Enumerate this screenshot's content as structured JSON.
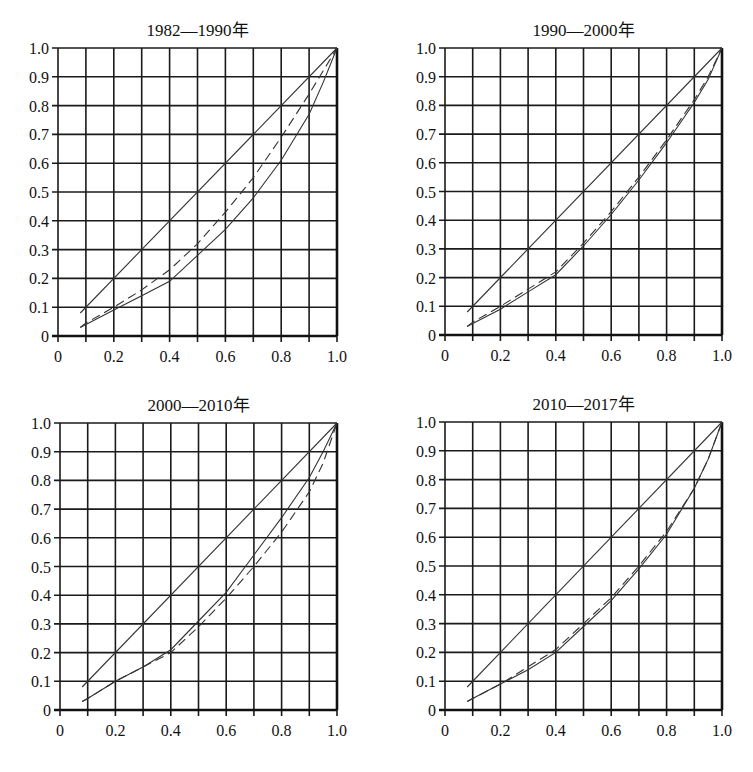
{
  "chart_data": [
    {
      "type": "line",
      "title": "1982—1990年",
      "xlabel": "",
      "ylabel": "",
      "xlim": [
        0,
        1.0
      ],
      "ylim": [
        0,
        1.0
      ],
      "grid": true,
      "x_ticks": [
        "0",
        "0.2",
        "0.4",
        "0.6",
        "0.8",
        "1.0"
      ],
      "y_ticks": [
        "0",
        "0.1",
        "0.2",
        "0.3",
        "0.4",
        "0.5",
        "0.6",
        "0.7",
        "0.8",
        "0.9",
        "1.0"
      ],
      "layout": {
        "x0": 58,
        "x1": 337,
        "y0": 336,
        "y1": 48
      },
      "series": [
        {
          "name": "equality-line",
          "style": "solid-thin",
          "x": [
            0.08,
            1.0
          ],
          "y": [
            0.08,
            1.0
          ]
        },
        {
          "name": "curve-solid",
          "style": "solid",
          "x": [
            0.08,
            0.1,
            0.2,
            0.3,
            0.4,
            0.5,
            0.6,
            0.7,
            0.8,
            0.9,
            0.95,
            1.0
          ],
          "y": [
            0.03,
            0.04,
            0.09,
            0.14,
            0.19,
            0.28,
            0.37,
            0.48,
            0.61,
            0.77,
            0.88,
            1.0
          ]
        },
        {
          "name": "curve-dashed",
          "style": "dashed",
          "x": [
            0.08,
            0.1,
            0.2,
            0.3,
            0.4,
            0.5,
            0.6,
            0.7,
            0.8,
            0.9,
            0.95,
            1.0
          ],
          "y": [
            0.03,
            0.045,
            0.1,
            0.16,
            0.23,
            0.32,
            0.43,
            0.55,
            0.69,
            0.84,
            0.92,
            1.0
          ]
        }
      ]
    },
    {
      "type": "line",
      "title": "1990—2000年",
      "xlabel": "",
      "ylabel": "",
      "xlim": [
        0,
        1.0
      ],
      "ylim": [
        0,
        1.0
      ],
      "grid": true,
      "x_ticks": [
        "0",
        "0.2",
        "0.4",
        "0.6",
        "0.8",
        "1.0"
      ],
      "y_ticks": [
        "0",
        "0.1",
        "0.2",
        "0.3",
        "0.4",
        "0.5",
        "0.6",
        "0.7",
        "0.8",
        "0.9",
        "1.0"
      ],
      "layout": {
        "x0": 445,
        "x1": 722,
        "y0": 335,
        "y1": 48
      },
      "series": [
        {
          "name": "equality-line",
          "style": "solid-thin",
          "x": [
            0.08,
            1.0
          ],
          "y": [
            0.08,
            1.0
          ]
        },
        {
          "name": "curve-solid",
          "style": "solid",
          "x": [
            0.08,
            0.1,
            0.2,
            0.3,
            0.4,
            0.5,
            0.6,
            0.7,
            0.8,
            0.9,
            0.95,
            1.0
          ],
          "y": [
            0.03,
            0.04,
            0.09,
            0.15,
            0.21,
            0.31,
            0.42,
            0.54,
            0.67,
            0.81,
            0.89,
            1.0
          ]
        },
        {
          "name": "curve-dashed",
          "style": "dashed",
          "x": [
            0.08,
            0.1,
            0.2,
            0.3,
            0.4,
            0.5,
            0.6,
            0.7,
            0.8,
            0.9,
            0.95,
            1.0
          ],
          "y": [
            0.03,
            0.045,
            0.1,
            0.16,
            0.22,
            0.32,
            0.43,
            0.55,
            0.68,
            0.82,
            0.9,
            1.0
          ]
        }
      ]
    },
    {
      "type": "line",
      "title": "2000—2010年",
      "xlabel": "",
      "ylabel": "",
      "xlim": [
        0,
        1.0
      ],
      "ylim": [
        0,
        1.0
      ],
      "grid": true,
      "x_ticks": [
        "0",
        "0.2",
        "0.4",
        "0.6",
        "0.8",
        "1.0"
      ],
      "y_ticks": [
        "0",
        "0.1",
        "0.2",
        "0.3",
        "0.4",
        "0.5",
        "0.6",
        "0.7",
        "0.8",
        "0.9",
        "1.0"
      ],
      "layout": {
        "x0": 60,
        "x1": 337,
        "y0": 710,
        "y1": 423
      },
      "series": [
        {
          "name": "equality-line",
          "style": "solid-thin",
          "x": [
            0.08,
            1.0
          ],
          "y": [
            0.08,
            1.0
          ]
        },
        {
          "name": "curve-solid",
          "style": "solid",
          "x": [
            0.08,
            0.1,
            0.2,
            0.3,
            0.4,
            0.5,
            0.6,
            0.7,
            0.8,
            0.9,
            0.95,
            1.0
          ],
          "y": [
            0.03,
            0.04,
            0.1,
            0.15,
            0.21,
            0.31,
            0.41,
            0.54,
            0.67,
            0.81,
            0.9,
            1.0
          ]
        },
        {
          "name": "curve-dashed",
          "style": "dashed",
          "x": [
            0.08,
            0.1,
            0.2,
            0.3,
            0.4,
            0.5,
            0.6,
            0.7,
            0.8,
            0.9,
            0.95,
            1.0
          ],
          "y": [
            0.03,
            0.04,
            0.1,
            0.15,
            0.2,
            0.29,
            0.39,
            0.5,
            0.62,
            0.76,
            0.86,
            1.0
          ]
        }
      ]
    },
    {
      "type": "line",
      "title": "2010—2017年",
      "xlabel": "",
      "ylabel": "",
      "xlim": [
        0,
        1.0
      ],
      "ylim": [
        0,
        1.0
      ],
      "grid": true,
      "x_ticks": [
        "0",
        "0.2",
        "0.4",
        "0.6",
        "0.8",
        "1.0"
      ],
      "y_ticks": [
        "0",
        "0.1",
        "0.2",
        "0.3",
        "0.4",
        "0.5",
        "0.6",
        "0.7",
        "0.8",
        "0.9",
        "1.0"
      ],
      "layout": {
        "x0": 445,
        "x1": 722,
        "y0": 710,
        "y1": 422
      },
      "series": [
        {
          "name": "equality-line",
          "style": "solid-thin",
          "x": [
            0.08,
            1.0
          ],
          "y": [
            0.08,
            1.0
          ]
        },
        {
          "name": "curve-solid",
          "style": "solid",
          "x": [
            0.08,
            0.1,
            0.2,
            0.3,
            0.4,
            0.5,
            0.6,
            0.7,
            0.8,
            0.9,
            0.95,
            1.0
          ],
          "y": [
            0.03,
            0.04,
            0.09,
            0.14,
            0.2,
            0.29,
            0.38,
            0.49,
            0.61,
            0.77,
            0.87,
            1.0
          ]
        },
        {
          "name": "curve-dashed",
          "style": "dashed",
          "x": [
            0.08,
            0.1,
            0.2,
            0.3,
            0.4,
            0.5,
            0.6,
            0.7,
            0.8,
            0.9,
            0.95,
            1.0
          ],
          "y": [
            0.03,
            0.04,
            0.09,
            0.15,
            0.21,
            0.3,
            0.39,
            0.5,
            0.62,
            0.77,
            0.87,
            1.0
          ]
        }
      ]
    }
  ]
}
